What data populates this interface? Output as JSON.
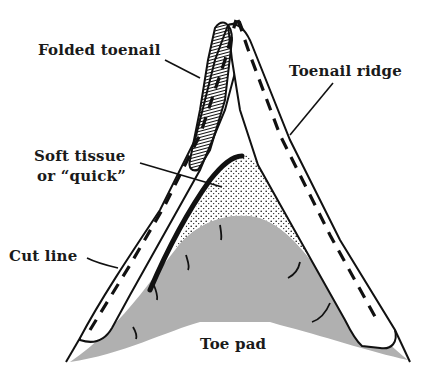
{
  "diagram": {
    "colors": {
      "ink": "#111111",
      "toe_pad_fill": "#b0b0b0",
      "nail_fill": "#ffffff",
      "background": "#ffffff"
    },
    "labels": {
      "folded_toenail": "Folded toenail",
      "toenail_ridge": "Toenail ridge",
      "soft_tissue_line1": "Soft tissue",
      "soft_tissue_line2": "or “quick”",
      "cut_line": "Cut line",
      "toe_pad": "Toe pad"
    }
  }
}
